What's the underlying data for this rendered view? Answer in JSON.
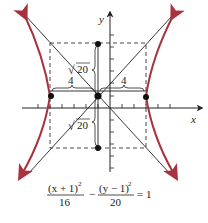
{
  "diagram": {
    "type": "hyperbola-graph",
    "axes": {
      "x_label": "x",
      "y_label": "y"
    },
    "center": {
      "x": -1,
      "y": 1
    },
    "a": 4,
    "b_label": "√20",
    "labels": {
      "horizontal_left": "4",
      "horizontal_right": "4",
      "vertical_top": "20",
      "vertical_bottom": "20",
      "sqrt_symbol": "√"
    },
    "equation": {
      "num1": "(x + 1)",
      "sup1": "2",
      "den1": "16",
      "minus": "−",
      "num2": "(y − 1)",
      "sup2": "2",
      "den2": "20",
      "eq": "= 1"
    },
    "colors": {
      "curve": "#a8323e",
      "axes": "#222222",
      "dashed": "#333333"
    }
  }
}
